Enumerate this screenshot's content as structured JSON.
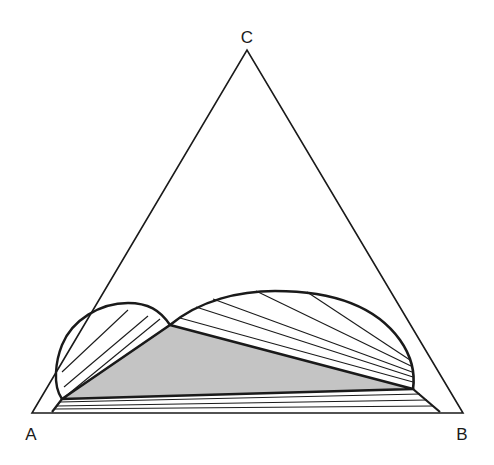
{
  "diagram": {
    "vertices": {
      "A": {
        "label": "A",
        "x": 32,
        "y": 413
      },
      "B": {
        "label": "B",
        "x": 463,
        "y": 413
      },
      "C": {
        "label": "C",
        "x": 247,
        "y": 50
      }
    },
    "colors": {
      "line": "#1a1a1a",
      "three_phase_fill": "#c4c4c4",
      "background": "#ffffff"
    },
    "three_phase_triangle": [
      [
        62,
        399
      ],
      [
        170,
        325
      ],
      [
        413,
        389
      ]
    ],
    "left_lobe_curve": "M 62 399 C 52 385, 56 360, 62 345 C 72 320, 100 303, 128 303 C 148 303, 160 310, 170 325",
    "right_lobe_curve": "M 170 325 C 200 300, 240 291, 275 291 C 330 291, 375 305, 400 340 C 412 357, 415 375, 413 389",
    "bottom_band_boundary": "M 62 399 L 52 412 M 413 389 L 440 412",
    "tie_lines": {
      "left_lobe": [
        [
          [
            62,
            372
          ],
          [
            128,
            310
          ]
        ],
        [
          [
            64,
            387
          ],
          [
            148,
            316
          ]
        ],
        [
          [
            66,
            396
          ],
          [
            160,
            319
          ]
        ]
      ],
      "right_lobe": [
        [
          [
            180,
            318
          ],
          [
            413,
            382
          ]
        ],
        [
          [
            196,
            307
          ],
          [
            413,
            377
          ]
        ],
        [
          [
            213,
            299
          ],
          [
            412,
            372
          ]
        ],
        [
          [
            256,
            291
          ],
          [
            411,
            366
          ]
        ],
        [
          [
            307,
            292
          ],
          [
            410,
            360
          ]
        ]
      ],
      "bottom_band": [
        [
          [
            60,
            402
          ],
          [
            420,
            394
          ]
        ],
        [
          [
            57,
            406
          ],
          [
            427,
            400
          ]
        ],
        [
          [
            55,
            409
          ],
          [
            433,
            406
          ]
        ]
      ]
    }
  }
}
